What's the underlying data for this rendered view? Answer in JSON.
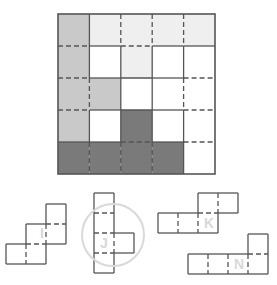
{
  "puzzle": {
    "grid": {
      "rows": 5,
      "cols": 5,
      "origin": [
        58,
        14
      ],
      "cell_w": 31.4,
      "cell_h": 32,
      "colors": {
        "L": "#c9c9c9",
        "V": "#efefef",
        "W": "#ffffff",
        "D": "#7a7a7a"
      },
      "cells": [
        [
          "L",
          "V",
          "V",
          "V",
          "V"
        ],
        [
          "L",
          "W",
          "V",
          "W",
          "W"
        ],
        [
          "L",
          "L",
          "W",
          "W",
          "W"
        ],
        [
          "L",
          "W",
          "D",
          "W",
          "W"
        ],
        [
          "D",
          "D",
          "D",
          "D",
          "W"
        ]
      ],
      "vertical_lines_dashed": [
        [
          false,
          true,
          true,
          true
        ],
        [
          false,
          false,
          false,
          false
        ],
        [
          true,
          false,
          false,
          true
        ],
        [
          false,
          false,
          false,
          false
        ],
        [
          true,
          true,
          true,
          false
        ]
      ],
      "horizontal_lines_dashed": [
        [
          true,
          false,
          true,
          false,
          false
        ],
        [
          true,
          false,
          false,
          false,
          true
        ],
        [
          true,
          false,
          false,
          false,
          true
        ],
        [
          false,
          false,
          true,
          false,
          true
        ]
      ]
    },
    "pieces": [
      {
        "label": "I",
        "cell": 20,
        "origin": [
          6,
          204
        ],
        "cells": [
          [
            2,
            0
          ],
          [
            1,
            1
          ],
          [
            2,
            1
          ],
          [
            0,
            2
          ],
          [
            1,
            2
          ]
        ],
        "dashed_edges": [
          [
            [
              2,
              1
            ],
            [
              3,
              1
            ]
          ],
          [
            [
              1,
              2
            ],
            [
              3,
              2
            ]
          ],
          [
            [
              2,
              1
            ],
            [
              2,
              2
            ]
          ],
          [
            [
              1,
              2
            ],
            [
              1,
              3
            ]
          ]
        ],
        "label_pos": [
          40,
          238
        ],
        "circled": false
      },
      {
        "label": "J",
        "cell": 20,
        "origin": [
          94,
          193
        ],
        "cells": [
          [
            0,
            0
          ],
          [
            0,
            1
          ],
          [
            0,
            2
          ],
          [
            1,
            2
          ],
          [
            0,
            3
          ]
        ],
        "dashed_edges": [
          [
            [
              0,
              1
            ],
            [
              1,
              1
            ]
          ],
          [
            [
              0,
              2
            ],
            [
              1,
              2
            ]
          ],
          [
            [
              0,
              3
            ],
            [
              1,
              3
            ]
          ],
          [
            [
              1,
              2
            ],
            [
              1,
              3
            ]
          ]
        ],
        "label_pos": [
          100,
          248
        ],
        "circled": true,
        "circle": {
          "cx": 113,
          "cy": 235,
          "r": 31
        }
      },
      {
        "label": "K",
        "cell": 20,
        "origin": [
          158,
          193
        ],
        "cells": [
          [
            2,
            0
          ],
          [
            3,
            0
          ],
          [
            0,
            1
          ],
          [
            1,
            1
          ],
          [
            2,
            1
          ]
        ],
        "dashed_edges": [
          [
            [
              3,
              0
            ],
            [
              3,
              1
            ]
          ],
          [
            [
              2,
              1
            ],
            [
              3,
              1
            ]
          ],
          [
            [
              1,
              1
            ],
            [
              1,
              2
            ]
          ],
          [
            [
              2,
              1
            ],
            [
              2,
              2
            ]
          ]
        ],
        "label_pos": [
          204,
          228
        ],
        "circled": false
      },
      {
        "label": "N",
        "cell": 20,
        "origin": [
          188,
          234
        ],
        "cells": [
          [
            3,
            0
          ],
          [
            0,
            1
          ],
          [
            1,
            1
          ],
          [
            2,
            1
          ],
          [
            3,
            1
          ]
        ],
        "dashed_edges": [
          [
            [
              3,
              1
            ],
            [
              4,
              1
            ]
          ],
          [
            [
              1,
              1
            ],
            [
              1,
              2
            ]
          ],
          [
            [
              2,
              1
            ],
            [
              2,
              2
            ]
          ],
          [
            [
              3,
              1
            ],
            [
              3,
              2
            ]
          ]
        ],
        "label_pos": [
          234,
          269
        ],
        "circled": false
      }
    ],
    "line_color": "#555555",
    "circle_color": "#d9d9d9"
  }
}
